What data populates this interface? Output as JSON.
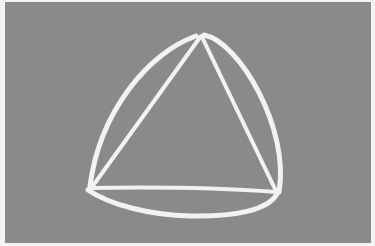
{
  "figure": {
    "colors": {
      "background": "#8a8a8a",
      "stroke": "#f2f2f2",
      "margin": "#f4f4f4"
    },
    "vertices": {
      "top": [
        201,
        35
      ],
      "bottom_left": [
        89,
        188
      ],
      "bottom_right": [
        277,
        193
      ]
    }
  }
}
